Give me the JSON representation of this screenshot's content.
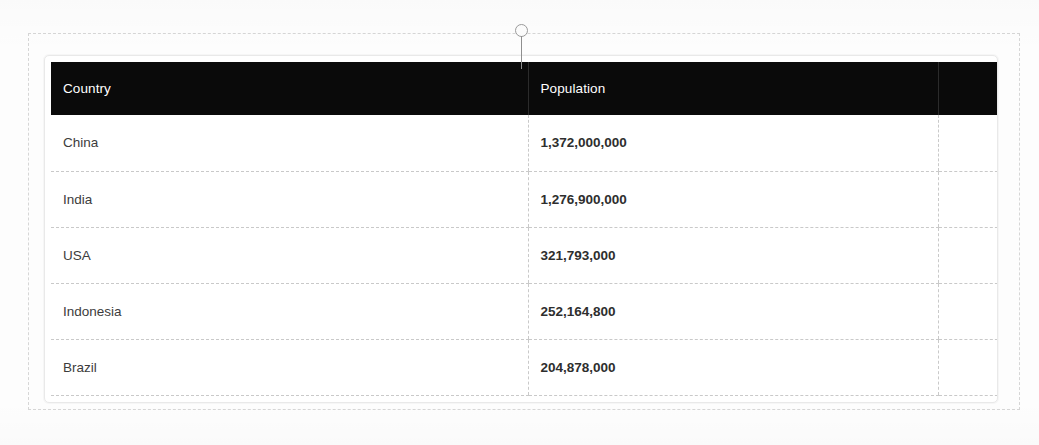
{
  "document": {
    "title": "Population Table",
    "background_color": "#fdfdfd"
  },
  "selection_frame": {
    "name": "content-placeholder-frame",
    "border_style": "dashed",
    "border_color": "#d6d6d6"
  },
  "column_resize_handle": {
    "name": "column-resize-handle",
    "label": "",
    "knob_color": "#fbfbfb",
    "knob_border_color": "#9a9a9a",
    "stem_color": "#8f8f8f"
  },
  "table": {
    "header_background": "#0a0a0a",
    "header_text_color": "#ffffff",
    "grid_line_color": "#c9c9c9",
    "border_color": "#e9e9e9",
    "columns": [
      {
        "key": "country",
        "label": "Country"
      },
      {
        "key": "population",
        "label": "Population"
      },
      {
        "key": "spacer",
        "label": ""
      }
    ],
    "rows": [
      {
        "country": "China",
        "population": "1,372,000,000"
      },
      {
        "country": "India",
        "population": "1,276,900,000"
      },
      {
        "country": "USA",
        "population": "321,793,000"
      },
      {
        "country": "Indonesia",
        "population": "252,164,800"
      },
      {
        "country": "Brazil",
        "population": "204,878,000"
      }
    ]
  }
}
